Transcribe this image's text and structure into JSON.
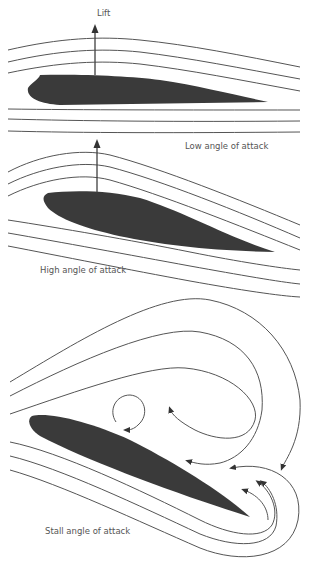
{
  "diagram": {
    "panels": [
      {
        "id": "low",
        "label": "Low angle of attack",
        "arrow_label": "Lift"
      },
      {
        "id": "high",
        "label": "High angle of attack"
      },
      {
        "id": "stall",
        "label": "Stall angle of attack"
      }
    ],
    "colors": {
      "airfoil": "#3a3a3a",
      "streamline": "#555555",
      "text": "#555555",
      "background": "#ffffff"
    }
  }
}
